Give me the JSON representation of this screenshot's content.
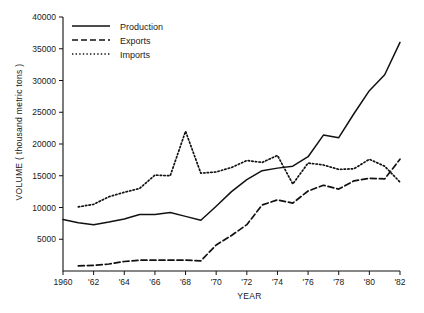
{
  "chart_data": {
    "type": "line",
    "title": "",
    "xlabel": "YEAR",
    "ylabel": "VOLUME ( thousand metric tons )",
    "xlim": [
      1960,
      1982
    ],
    "ylim": [
      0,
      40000
    ],
    "grid": false,
    "legend_position": "top-left",
    "x_tick_labels": [
      "1960",
      "'62",
      "'64",
      "'66",
      "'68",
      "'70",
      "'72",
      "'74",
      "'76",
      "'78",
      "'80",
      "'82"
    ],
    "x_ticks": [
      1960,
      1962,
      1964,
      1966,
      1968,
      1970,
      1972,
      1974,
      1976,
      1978,
      1980,
      1982
    ],
    "y_ticks": [
      5000,
      10000,
      15000,
      20000,
      25000,
      30000,
      35000,
      40000
    ],
    "y_tick_labels": [
      "5000",
      "10000",
      "15000",
      "20000",
      "25000",
      "30000",
      "35000",
      "40000"
    ],
    "x": [
      1960,
      1961,
      1962,
      1963,
      1964,
      1965,
      1966,
      1967,
      1968,
      1969,
      1970,
      1971,
      1972,
      1973,
      1974,
      1975,
      1976,
      1977,
      1978,
      1979,
      1980,
      1981
    ],
    "series": [
      {
        "name": "Production",
        "style": "solid",
        "values": [
          8100,
          7600,
          7300,
          7700,
          8200,
          8900,
          8900,
          9200,
          8600,
          8000,
          10200,
          12500,
          14400,
          15800,
          16200,
          16500,
          18000,
          21400,
          21000,
          24800,
          28400,
          30900,
          36000
        ],
        "x": [
          1960,
          1961,
          1962,
          1963,
          1964,
          1965,
          1966,
          1967,
          1968,
          1969,
          1970,
          1971,
          1972,
          1973,
          1974,
          1975,
          1976,
          1977,
          1978,
          1979,
          1980,
          1981,
          1982
        ]
      },
      {
        "name": "Exports",
        "style": "dashed",
        "values": [
          800,
          900,
          1100,
          1500,
          1700,
          1700,
          1700,
          1700,
          1600,
          4100,
          5600,
          7300,
          10400,
          11200,
          10700,
          12600,
          13500,
          12900,
          14200,
          14600,
          14500,
          17600
        ],
        "x": [
          1961,
          1962,
          1963,
          1964,
          1965,
          1966,
          1967,
          1968,
          1969,
          1970,
          1971,
          1972,
          1973,
          1974,
          1975,
          1976,
          1977,
          1978,
          1979,
          1980,
          1981,
          1982
        ]
      },
      {
        "name": "Imports",
        "style": "dotted",
        "values": [
          10100,
          10500,
          11700,
          12400,
          13000,
          15100,
          15000,
          22000,
          15400,
          15600,
          16300,
          17400,
          17100,
          18200,
          13700,
          17000,
          16700,
          16000,
          16100,
          17600,
          16500,
          14000
        ],
        "x": [
          1961,
          1962,
          1963,
          1964,
          1965,
          1966,
          1967,
          1968,
          1969,
          1970,
          1971,
          1972,
          1973,
          1974,
          1975,
          1976,
          1977,
          1978,
          1979,
          1980,
          1981,
          1982
        ]
      }
    ],
    "legend": [
      {
        "label": "Production",
        "style": "solid"
      },
      {
        "label": "Exports",
        "style": "dashed"
      },
      {
        "label": "Imports",
        "style": "dotted"
      }
    ]
  }
}
